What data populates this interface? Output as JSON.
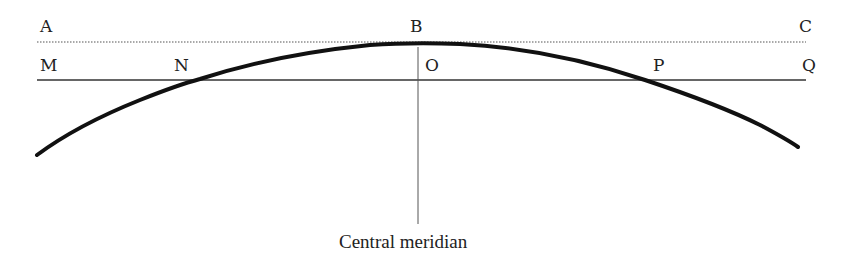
{
  "labels": {
    "A": "A",
    "B": "B",
    "C": "C",
    "M": "M",
    "N": "N",
    "O": "O",
    "P": "P",
    "Q": "Q"
  },
  "caption": "Central meridian",
  "colors": {
    "line": "#222222",
    "curve": "#111111",
    "dotted": "#555555"
  }
}
